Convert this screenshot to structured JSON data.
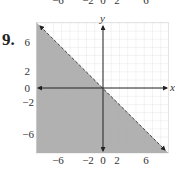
{
  "problem": {
    "number": "9."
  },
  "top_tick_labels": [
    "−6",
    "−2",
    "0",
    "2",
    "6"
  ],
  "graph": {
    "x_axis_label": "x",
    "y_axis_label": "y",
    "x_tick_labels": [
      "−6",
      "−2",
      "0",
      "2",
      "6"
    ],
    "y_tick_labels": [
      "6",
      "2",
      "0",
      "−2",
      "−6"
    ],
    "boundary_line": "y = -x (dashed)",
    "shaded_region": "below-left of line",
    "shade_color": "#a9a9a9",
    "grid_color": "#d8d8d8"
  }
}
